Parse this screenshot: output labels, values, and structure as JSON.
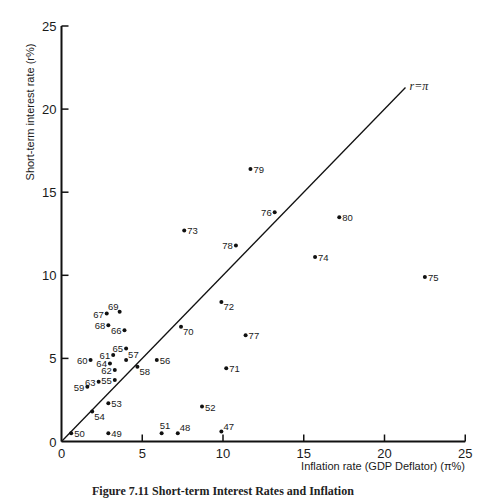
{
  "chart_data": {
    "type": "scatter",
    "title": "",
    "xlabel": "Inflation rate (GDP Deflator) (π%)",
    "ylabel": "Short-term interest rate (r%)",
    "xlim": [
      0,
      25
    ],
    "ylim": [
      0,
      25
    ],
    "xticks": [
      0,
      5,
      10,
      15,
      20,
      25
    ],
    "yticks": [
      0,
      5,
      10,
      15,
      20,
      25
    ],
    "grid": false,
    "legend": null,
    "reference_line": {
      "label": "r=π",
      "x": [
        0,
        21.3
      ],
      "y": [
        0,
        21.3
      ]
    },
    "points": [
      {
        "label": "47",
        "x": 9.9,
        "y": 0.6,
        "pos": "ar"
      },
      {
        "label": "48",
        "x": 7.2,
        "y": 0.5,
        "pos": "ar"
      },
      {
        "label": "49",
        "x": 2.9,
        "y": 0.5,
        "pos": "r"
      },
      {
        "label": "50",
        "x": 0.6,
        "y": 0.5,
        "pos": "r"
      },
      {
        "label": "51",
        "x": 6.2,
        "y": 0.5,
        "pos": "a"
      },
      {
        "label": "52",
        "x": 8.7,
        "y": 2.1,
        "pos": "r"
      },
      {
        "label": "53",
        "x": 2.9,
        "y": 2.3,
        "pos": "r"
      },
      {
        "label": "54",
        "x": 1.9,
        "y": 1.8,
        "pos": "br"
      },
      {
        "label": "55",
        "x": 3.3,
        "y": 3.7,
        "pos": "l"
      },
      {
        "label": "56",
        "x": 5.9,
        "y": 4.9,
        "pos": "r"
      },
      {
        "label": "57",
        "x": 4.0,
        "y": 4.9,
        "pos": "ar"
      },
      {
        "label": "58",
        "x": 4.7,
        "y": 4.5,
        "pos": "br"
      },
      {
        "label": "59",
        "x": 1.6,
        "y": 3.3,
        "pos": "l"
      },
      {
        "label": "60",
        "x": 1.8,
        "y": 4.9,
        "pos": "l"
      },
      {
        "label": "61",
        "x": 3.2,
        "y": 5.2,
        "pos": "l"
      },
      {
        "label": "62",
        "x": 3.3,
        "y": 4.3,
        "pos": "l"
      },
      {
        "label": "63",
        "x": 2.3,
        "y": 3.6,
        "pos": "l"
      },
      {
        "label": "64",
        "x": 3.0,
        "y": 4.7,
        "pos": "l"
      },
      {
        "label": "65",
        "x": 4.0,
        "y": 5.6,
        "pos": "l"
      },
      {
        "label": "66",
        "x": 3.9,
        "y": 6.7,
        "pos": "l"
      },
      {
        "label": "67",
        "x": 2.8,
        "y": 7.7,
        "pos": "l"
      },
      {
        "label": "68",
        "x": 2.9,
        "y": 7.0,
        "pos": "l"
      },
      {
        "label": "69",
        "x": 3.6,
        "y": 7.8,
        "pos": "al"
      },
      {
        "label": "70",
        "x": 7.4,
        "y": 6.9,
        "pos": "br"
      },
      {
        "label": "71",
        "x": 10.2,
        "y": 4.4,
        "pos": "r"
      },
      {
        "label": "72",
        "x": 9.9,
        "y": 8.4,
        "pos": "br"
      },
      {
        "label": "73",
        "x": 7.6,
        "y": 12.7,
        "pos": "r"
      },
      {
        "label": "74",
        "x": 15.7,
        "y": 11.1,
        "pos": "r"
      },
      {
        "label": "75",
        "x": 22.5,
        "y": 9.9,
        "pos": "r"
      },
      {
        "label": "76",
        "x": 13.2,
        "y": 13.8,
        "pos": "l"
      },
      {
        "label": "77",
        "x": 11.4,
        "y": 6.4,
        "pos": "r"
      },
      {
        "label": "78",
        "x": 10.8,
        "y": 11.8,
        "pos": "l"
      },
      {
        "label": "79",
        "x": 11.7,
        "y": 16.4,
        "pos": "r"
      },
      {
        "label": "80",
        "x": 17.2,
        "y": 13.5,
        "pos": "r"
      }
    ]
  },
  "caption": "Figure 7.11 Short-term Interest Rates and Inflation"
}
